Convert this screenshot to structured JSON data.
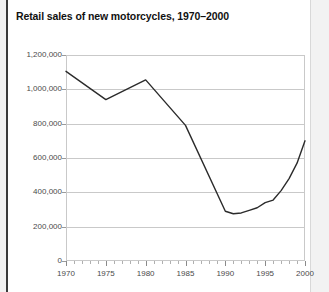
{
  "figure": {
    "background_color": "#f2f2f2",
    "panel_color": "#ffffff",
    "rule_color": "#3a3a3a",
    "grid_color": "#c9c9c9",
    "line_color": "#2b2b2b",
    "text_color": "#4a4a4a"
  },
  "chart_data": {
    "type": "line",
    "title": "Retail sales of new motorcycles, 1970–2000",
    "xlabel": "",
    "ylabel": "",
    "xlim": [
      1970,
      2000
    ],
    "ylim": [
      0,
      1200000
    ],
    "grid": true,
    "grid_axis": "y",
    "legend": false,
    "legend_position": "none",
    "x_ticks": [
      1970,
      1975,
      1980,
      1985,
      1990,
      1995,
      2000
    ],
    "x_tick_labels": [
      "1970",
      "1975",
      "1980",
      "1985",
      "1990",
      "1995",
      "2000"
    ],
    "x_minor_tick_interval": 1,
    "y_ticks": [
      0,
      200000,
      400000,
      600000,
      800000,
      1000000,
      1200000
    ],
    "y_tick_labels": [
      "0",
      "200,000",
      "400,000",
      "600,000",
      "800,000",
      "1,000,000",
      "1,200,000"
    ],
    "x": [
      1970,
      1975,
      1980,
      1985,
      1990,
      1991,
      1992,
      1993,
      1994,
      1995,
      1996,
      1997,
      1998,
      1999,
      2000
    ],
    "values": [
      1105000,
      940000,
      1055000,
      790000,
      290000,
      275000,
      280000,
      295000,
      310000,
      340000,
      355000,
      410000,
      480000,
      570000,
      700000
    ],
    "series": [
      {
        "name": "Retail sales of new motorcycles",
        "color": "#2b2b2b",
        "values": [
          1105000,
          940000,
          1055000,
          790000,
          290000,
          275000,
          280000,
          295000,
          310000,
          340000,
          355000,
          410000,
          480000,
          570000,
          700000
        ]
      }
    ]
  }
}
